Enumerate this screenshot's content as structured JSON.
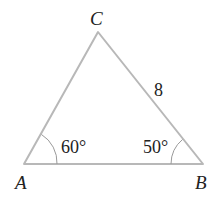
{
  "diagram": {
    "type": "triangle",
    "vertices": {
      "A": {
        "label": "A",
        "x": 24,
        "y": 164
      },
      "B": {
        "label": "B",
        "x": 203,
        "y": 164
      },
      "C": {
        "label": "C",
        "x": 98,
        "y": 32
      }
    },
    "angles": {
      "A": {
        "label": "60°",
        "value": 60
      },
      "B": {
        "label": "50°",
        "value": 50
      }
    },
    "sides": {
      "BC": {
        "label": "8",
        "value": 8
      }
    },
    "colors": {
      "edge": "#b8b8b8",
      "text": "#222222"
    }
  }
}
